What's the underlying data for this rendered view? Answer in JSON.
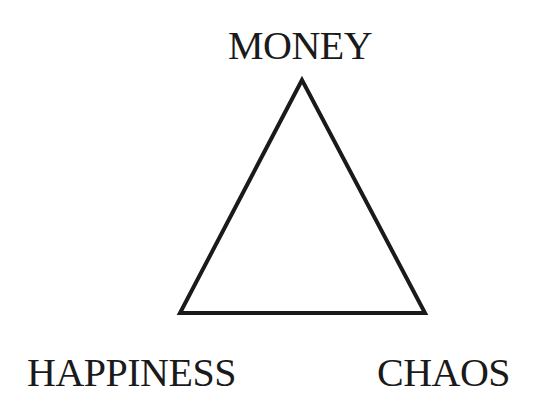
{
  "diagram": {
    "type": "triangle",
    "vertices": {
      "top": "MONEY",
      "bottom_left": "HAPPINESS",
      "bottom_right": "CHAOS"
    },
    "stroke_color": "#1a1a1a",
    "background": "#ffffff"
  }
}
